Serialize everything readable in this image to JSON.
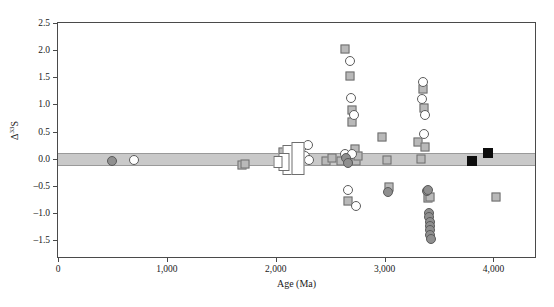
{
  "chart_data": {
    "type": "scatter",
    "title": "",
    "xlabel": "Age (Ma)",
    "ylabel": "Δ33S",
    "ylabel_base": "Δ",
    "ylabel_sup": "33",
    "ylabel_tail": "S",
    "xlim": [
      0,
      4400
    ],
    "ylim": [
      -1.85,
      2.5
    ],
    "grid": false,
    "legend": "none",
    "xticks": [
      0,
      1000,
      2000,
      3000,
      4000
    ],
    "xticklabels": [
      "0",
      "1,000",
      "2,000",
      "3,000",
      "4,000"
    ],
    "yticks": [
      -1.5,
      -1.0,
      -0.5,
      0.0,
      0.5,
      1.0,
      1.5,
      2.0,
      2.5
    ],
    "yticklabels": [
      "–1.5",
      "–1.0",
      "–0.5",
      "0.0",
      "0.5",
      "1.0",
      "1.5",
      "2.0",
      "2.5"
    ],
    "reference_band": {
      "label": "mass-dependent field",
      "ymin": -0.14,
      "ymax": 0.1,
      "color": "#c9c9c9"
    },
    "marker_colors": {
      "gray_square": "#b9b9b9",
      "open_square": "#ffffff",
      "black_square": "#0d0d0d",
      "open_circle": "#ffffff",
      "gray_circle": "#8f8f8f",
      "dark_circle": "#7b7b7b",
      "outline": "#6e6e6e"
    },
    "series": [
      {
        "name": "gray squares",
        "marker": "gray_square",
        "points": [
          [
            1690,
            -0.12
          ],
          [
            1720,
            -0.1
          ],
          [
            2060,
            -0.07
          ],
          [
            2070,
            0.12
          ],
          [
            2460,
            -0.04
          ],
          [
            2520,
            0.02
          ],
          [
            2600,
            -0.05
          ],
          [
            2640,
            2.02
          ],
          [
            2660,
            -0.78
          ],
          [
            2680,
            1.52
          ],
          [
            2700,
            0.9
          ],
          [
            2700,
            0.68
          ],
          [
            2710,
            0.03
          ],
          [
            2730,
            0.17
          ],
          [
            2740,
            -0.05
          ],
          [
            2760,
            0.05
          ],
          [
            2980,
            0.4
          ],
          [
            3020,
            -0.03
          ],
          [
            3040,
            -0.52
          ],
          [
            3310,
            0.3
          ],
          [
            3330,
            0.0
          ],
          [
            3350,
            1.28
          ],
          [
            3360,
            0.93
          ],
          [
            3370,
            0.22
          ],
          [
            3400,
            -0.72
          ],
          [
            3420,
            -0.7
          ],
          [
            4020,
            -0.7
          ]
        ]
      },
      {
        "name": "open circles",
        "marker": "open_circle",
        "points": [
          [
            700,
            -0.02
          ],
          [
            2240,
            0.22
          ],
          [
            2270,
            0.05
          ],
          [
            2300,
            0.25
          ],
          [
            2310,
            -0.03
          ],
          [
            2640,
            0.08
          ],
          [
            2660,
            -0.57
          ],
          [
            2680,
            1.8
          ],
          [
            2690,
            1.12
          ],
          [
            2700,
            0.08
          ],
          [
            2720,
            0.8
          ],
          [
            2740,
            -0.88
          ],
          [
            3340,
            1.1
          ],
          [
            3350,
            1.42
          ],
          [
            3360,
            0.45
          ],
          [
            3370,
            0.8
          ]
        ]
      },
      {
        "name": "gray circles",
        "marker": "gray_circle",
        "points": [
          [
            500,
            -0.05
          ],
          [
            2650,
            0.02
          ],
          [
            2660,
            -0.08
          ],
          [
            3030,
            -0.62
          ],
          [
            3390,
            -0.6
          ],
          [
            3400,
            -0.58
          ],
          [
            3410,
            -1.0
          ],
          [
            3410,
            -1.08
          ],
          [
            3415,
            -1.16
          ],
          [
            3415,
            -1.24
          ],
          [
            3420,
            -1.32
          ],
          [
            3420,
            -1.4
          ],
          [
            3425,
            -1.48
          ]
        ]
      },
      {
        "name": "black squares",
        "marker": "black_square",
        "points": [
          [
            3800,
            -0.05
          ],
          [
            3950,
            0.1
          ]
        ]
      },
      {
        "name": "open range bars",
        "marker": "open_bar",
        "bars": [
          {
            "x": 2120,
            "ymin": -0.3,
            "ymax": 0.26,
            "width": 13
          },
          {
            "x": 2200,
            "ymin": -0.3,
            "ymax": 0.3,
            "width": 13
          },
          {
            "x": 2080,
            "ymin": -0.22,
            "ymax": 0.1,
            "width": 11
          },
          {
            "x": 2020,
            "ymin": -0.18,
            "ymax": 0.05,
            "width": 9
          }
        ]
      }
    ]
  }
}
